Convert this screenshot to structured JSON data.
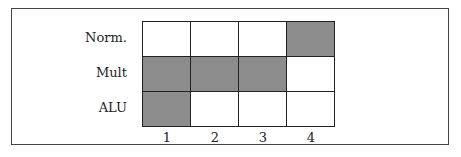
{
  "diagram": {
    "rows": [
      {
        "label": "Norm.",
        "cells": [
          false,
          false,
          false,
          true
        ]
      },
      {
        "label": "Mult",
        "cells": [
          true,
          true,
          true,
          false
        ]
      },
      {
        "label": "ALU",
        "cells": [
          true,
          false,
          false,
          false
        ]
      }
    ],
    "columns": [
      "1",
      "2",
      "3",
      "4"
    ],
    "colors": {
      "filled": "#8c8c8c",
      "empty": "#ffffff",
      "border": "#222222"
    }
  }
}
